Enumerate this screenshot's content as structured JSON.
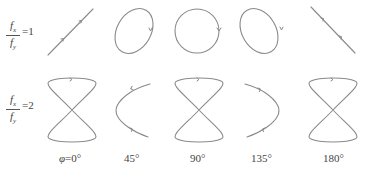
{
  "rows": [
    {
      "label_num": "f",
      "label_num_sub": "x",
      "label_den": "f",
      "label_den_sub": "y",
      "ratio_text": "=1"
    },
    {
      "label_num": "f",
      "label_num_sub": "x",
      "label_den": "f",
      "label_den_sub": "y",
      "ratio_text": "=2"
    }
  ],
  "phases": [
    {
      "prefix": "φ",
      "text": "=0°"
    },
    {
      "prefix": "",
      "text": "45°"
    },
    {
      "prefix": "",
      "text": "90°"
    },
    {
      "prefix": "",
      "text": "135°"
    },
    {
      "prefix": "",
      "text": "180°"
    }
  ],
  "figures": {
    "row1": [
      "line-diagonal-up",
      "ellipse-tilted-right",
      "circle",
      "ellipse-tilted-left",
      "line-diagonal-down"
    ],
    "row2": [
      "figure-eight",
      "parabola-open-right",
      "figure-eight",
      "parabola-open-left",
      "figure-eight"
    ]
  },
  "colors": {
    "curve": "#8a8a8a",
    "text": "#444444"
  }
}
